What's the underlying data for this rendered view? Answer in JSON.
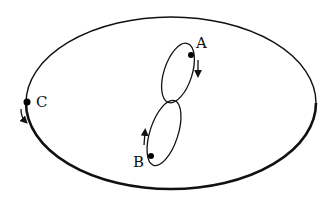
{
  "diagram": {
    "stroke_color": "#111111",
    "background": "#ffffff",
    "points": [
      {
        "id": "A",
        "label": "A",
        "direction": "down"
      },
      {
        "id": "B",
        "label": "B",
        "direction": "up"
      },
      {
        "id": "C",
        "label": "C",
        "direction": "down"
      }
    ]
  }
}
